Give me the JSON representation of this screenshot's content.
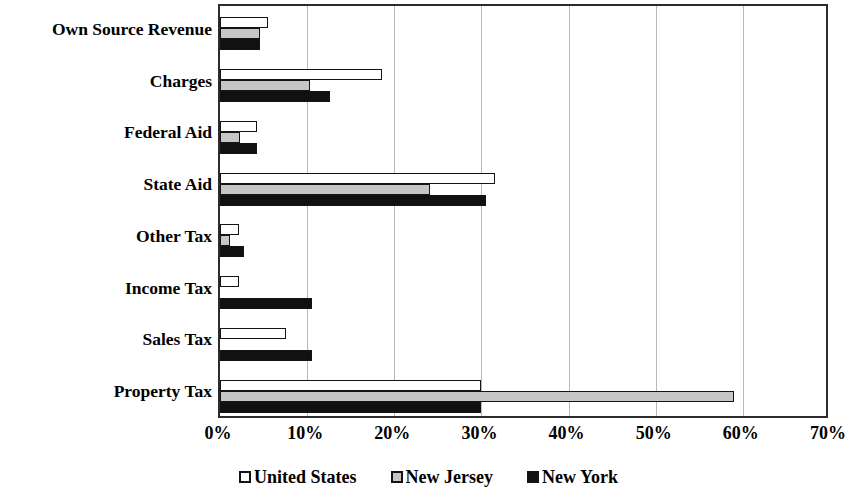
{
  "chart_data": {
    "type": "bar",
    "orientation": "horizontal",
    "title": "",
    "subtitle": "",
    "xlabel": "",
    "ylabel": "",
    "xlim": [
      0,
      70
    ],
    "xtick_labels": [
      "0%",
      "10%",
      "20%",
      "30%",
      "40%",
      "50%",
      "60%",
      "70%"
    ],
    "xtick_values": [
      0,
      10,
      20,
      30,
      40,
      50,
      60,
      70
    ],
    "grid": true,
    "legend_position": "bottom-center",
    "categories": [
      "Own Source Revenue",
      "Charges",
      "Federal Aid",
      "State Aid",
      "Other Tax",
      "Income Tax",
      "Sales Tax",
      "Property Tax"
    ],
    "series": [
      {
        "name": "United States",
        "color": "#ffffff",
        "values": [
          5.5,
          18.6,
          4.3,
          31.5,
          2.2,
          2.2,
          7.6,
          30.0
        ]
      },
      {
        "name": "New Jersey",
        "color": "#c6c6c6",
        "values": [
          4.6,
          10.3,
          2.3,
          24.1,
          1.2,
          0.0,
          0.0,
          59.0
        ]
      },
      {
        "name": "New York",
        "color": "#111111",
        "values": [
          4.6,
          12.6,
          4.3,
          30.5,
          2.7,
          10.6,
          10.6,
          30.0
        ]
      }
    ]
  },
  "legend": {
    "items": [
      {
        "label": "United States",
        "swatch": "legend-swatch-white"
      },
      {
        "label": "New Jersey",
        "swatch": "legend-swatch-gray"
      },
      {
        "label": "New York",
        "swatch": "legend-swatch-black"
      }
    ]
  },
  "colors": {
    "axis": "#2b2b2b",
    "gridline": "#b9b9b9",
    "bar_outline": "#141414",
    "united_states": "#ffffff",
    "new_jersey": "#c6c6c6",
    "new_york": "#111111",
    "background": "#ffffff"
  }
}
